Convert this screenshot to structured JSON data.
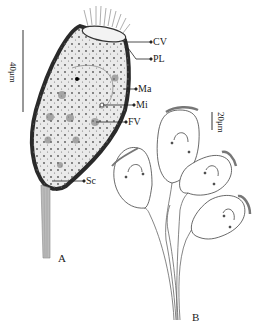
{
  "figure": {
    "panels": [
      {
        "id": "A",
        "label": "A",
        "scale_bar": "40μm"
      },
      {
        "id": "B",
        "label": "B",
        "scale_bar": "20μm"
      }
    ],
    "annotations": [
      {
        "key": "CV",
        "label": "CV"
      },
      {
        "key": "PL",
        "label": "PL"
      },
      {
        "key": "Ma",
        "label": "Ma"
      },
      {
        "key": "Mi",
        "label": "Mi"
      },
      {
        "key": "FV",
        "label": "FV"
      },
      {
        "key": "Sc",
        "label": "Sc"
      }
    ]
  }
}
